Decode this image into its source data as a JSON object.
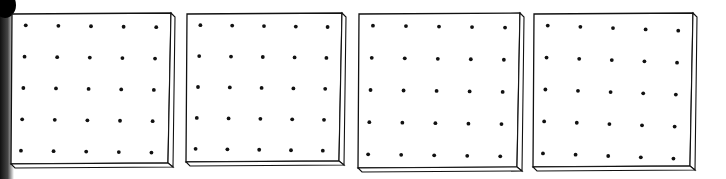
{
  "figure": {
    "boards": [
      {
        "id": "board-1",
        "rows": 5,
        "cols": 5,
        "x": 11,
        "y": 13,
        "w": 164,
        "h": 154
      },
      {
        "id": "board-2",
        "rows": 5,
        "cols": 5,
        "x": 186,
        "y": 13,
        "w": 160,
        "h": 152
      },
      {
        "id": "board-3",
        "rows": 5,
        "cols": 5,
        "x": 358,
        "y": 13,
        "w": 166,
        "h": 158
      },
      {
        "id": "board-4",
        "rows": 5,
        "cols": 5,
        "x": 533,
        "y": 13,
        "w": 164,
        "h": 157
      }
    ],
    "colors": {
      "ink": "#111111",
      "paper": "#ffffff"
    }
  }
}
